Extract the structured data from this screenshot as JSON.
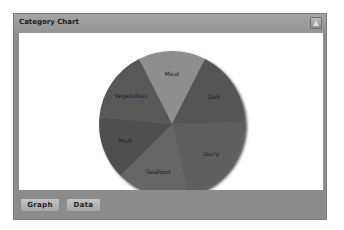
{
  "panel": {
    "title": "Category Chart",
    "collapse_icon": "triangle-up-icon"
  },
  "buttons": {
    "graph_label": "Graph",
    "data_label": "Data"
  },
  "chart_data": {
    "type": "pie",
    "title": "",
    "categories": [
      "Meat",
      "Deli",
      "Dairy",
      "Seafood",
      "Fruit",
      "Vegetables"
    ],
    "values": [
      15,
      17,
      22,
      16,
      14,
      16
    ],
    "colors": [
      "#8e8e8e",
      "#555555",
      "#5e5e5e",
      "#666666",
      "#4f4f4f",
      "#585858"
    ],
    "legend": "none",
    "labels_on_slices": true
  }
}
